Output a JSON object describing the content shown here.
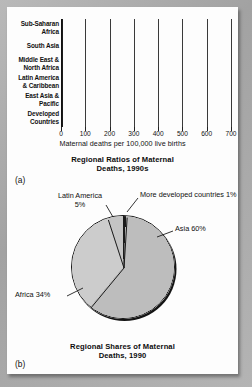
{
  "figure_a": {
    "panel_id": "(a)",
    "caption_line1": "Regional Ratios of Maternal",
    "caption_line2": "Deaths, 1990s",
    "x_axis_title": "Maternal deaths per 100,000 live births",
    "tick_labels": [
      "0",
      "100",
      "200",
      "300",
      "400",
      "500",
      "600",
      "700"
    ],
    "categories": [
      "Sub-Saharan\nAfrica",
      "South Asia",
      "Middle East &\nNorth Africa",
      "Latin America\n& Caribbean",
      "East Asia &\nPacific",
      "Developed\nCountries"
    ]
  },
  "figure_b": {
    "panel_id": "(b)",
    "caption_line1": "Regional Shares of Maternal",
    "caption_line2": "Deaths, 1990",
    "labels": {
      "asia": "Asia 60%",
      "africa": "Africa 34%",
      "latin_america_l1": "Latin America",
      "latin_america_l2": "5%",
      "developed": "More developed countries 1%"
    }
  },
  "colors": {
    "bar_fill": "#b6b6b6",
    "outline": "#1c1c1c",
    "pie_asia": "#bdbdbd",
    "pie_africa": "#cccccc",
    "pie_latin": "#c4c4c4",
    "pie_developed": "#1a1a1a",
    "page_background": "#a8a8a8",
    "card_background": "#fdfdfd"
  },
  "chart_data": [
    {
      "type": "bar",
      "orientation": "horizontal",
      "title": "Regional Ratios of Maternal Deaths, 1990s",
      "xlabel": "Maternal deaths per 100,000 live births",
      "ylabel": "",
      "xlim": [
        0,
        700
      ],
      "xticks": [
        0,
        100,
        200,
        300,
        400,
        500,
        600,
        700
      ],
      "grid": true,
      "legend": "none",
      "categories": [
        "Sub-Saharan Africa",
        "South Asia",
        "Middle East & North Africa",
        "Latin America & Caribbean",
        "East Asia & Pacific",
        "Developed Countries"
      ],
      "values": [
        615,
        490,
        205,
        190,
        155,
        13
      ]
    },
    {
      "type": "pie",
      "title": "Regional Shares of Maternal Deaths, 1990",
      "legend": "labels-with-leader-lines",
      "categories": [
        "More developed countries",
        "Asia",
        "Africa",
        "Latin America"
      ],
      "values": [
        1,
        60,
        34,
        5
      ],
      "labels": [
        "More developed countries 1%",
        "Asia 60%",
        "Africa 34%",
        "Latin America 5%"
      ],
      "start_angle_deg": 0,
      "direction": "clockwise"
    }
  ]
}
